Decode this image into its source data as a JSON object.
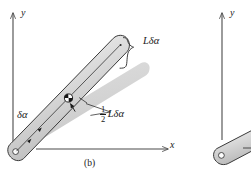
{
  "figure": {
    "caption": "(b)",
    "panel_a_partial_note": "",
    "axes": {
      "y_label": "y",
      "x_label": "x"
    },
    "labels": {
      "angle": "δα",
      "tip_displacement": "Lδα",
      "com_displacement_fraction_num": "1",
      "com_displacement_fraction_den": "2",
      "com_displacement_tail": "Lδα"
    },
    "right_panel": {
      "y_label": "y"
    },
    "colors": {
      "ink": "#1a1a1a",
      "axis": "#4a4a4a",
      "rod_outline": "#3a3a3a",
      "rod_fill_light": "#f2f2f2",
      "rod_fill_mid": "#c9c9c9",
      "shadow_rod_fill": "#d5d5d5",
      "background": "#ffffff"
    }
  }
}
